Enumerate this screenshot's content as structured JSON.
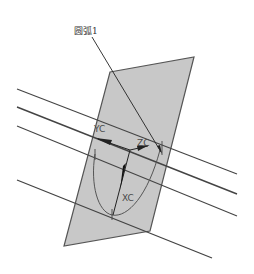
{
  "diagram": {
    "callout_label": "圆弧1",
    "axes": {
      "yc": "YC",
      "zc": "ZC",
      "xc": "XC"
    },
    "colors": {
      "plane_fill": "#c8c8c8",
      "plane_stroke": "#555555",
      "line_stroke": "#444444",
      "arc_stroke": "#555555",
      "axis_stroke": "#222222"
    },
    "caption": ""
  }
}
